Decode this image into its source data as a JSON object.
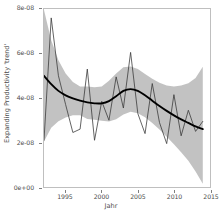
{
  "chart_data": {
    "type": "line",
    "title": "",
    "xlabel": "Jahr",
    "ylabel": "Expanding Productivity 'trend'",
    "xlim": [
      1992,
      2015
    ],
    "ylim": [
      0,
      8e-08
    ],
    "grid": false,
    "legend": null,
    "x_ticks": [
      1995,
      2000,
      2005,
      2010,
      2015
    ],
    "x_tick_labels": [
      "1995",
      "2000",
      "2005",
      "2010",
      "2015"
    ],
    "y_ticks": [
      0,
      2e-08,
      4e-08,
      6e-08,
      8e-08
    ],
    "y_tick_labels": [
      "0e+00",
      "2e-08",
      "4e-08",
      "6e-08",
      "8e-08"
    ],
    "colors": {
      "observed_line": "#3a3a3a",
      "trend_line": "#000000",
      "confidence_ribbon": "#bfbfbf",
      "panel_background": "#ffffff",
      "panel_border": "#bfbfbf",
      "axis_text": "#4d4d4d"
    },
    "series": [
      {
        "name": "observed",
        "type": "line",
        "x": [
          1992,
          1993,
          1994,
          1995,
          1996,
          1997,
          1998,
          1999,
          2000,
          2001,
          2002,
          2003,
          2004,
          2005,
          2006,
          2007,
          2008,
          2009,
          2010,
          2011,
          2012,
          2013,
          2014
        ],
        "values": [
          2.1e-08,
          7.6e-08,
          5e-08,
          3.7e-08,
          2.45e-08,
          2.6e-08,
          5.3e-08,
          2.1e-08,
          3.85e-08,
          3e-08,
          4.95e-08,
          3.55e-08,
          6.05e-08,
          3.3e-08,
          2.4e-08,
          4.65e-08,
          2.9e-08,
          1.95e-08,
          4.15e-08,
          2.3e-08,
          3.45e-08,
          2.5e-08,
          2.95e-08
        ]
      },
      {
        "name": "trend",
        "type": "line",
        "x": [
          1992,
          1993,
          1994,
          1995,
          1996,
          1997,
          1998,
          1999,
          2000,
          2001,
          2002,
          2003,
          2004,
          2005,
          2006,
          2007,
          2008,
          2009,
          2010,
          2011,
          2012,
          2013,
          2014
        ],
        "values": [
          5e-08,
          4.62e-08,
          4.32e-08,
          4.12e-08,
          3.98e-08,
          3.88e-08,
          3.8e-08,
          3.76e-08,
          3.76e-08,
          3.86e-08,
          4.08e-08,
          4.32e-08,
          4.4e-08,
          4.32e-08,
          4.12e-08,
          3.88e-08,
          3.64e-08,
          3.42e-08,
          3.22e-08,
          3.04e-08,
          2.88e-08,
          2.72e-08,
          2.6e-08
        ]
      }
    ],
    "ribbon": {
      "name": "confidence_interval",
      "x": [
        1992,
        1993,
        1994,
        1995,
        1996,
        1997,
        1998,
        1999,
        2000,
        2001,
        2002,
        2003,
        2004,
        2005,
        2006,
        2007,
        2008,
        2009,
        2010,
        2011,
        2012,
        2013,
        2014
      ],
      "upper": [
        7.95e-08,
        6.6e-08,
        5.7e-08,
        5.1e-08,
        4.72e-08,
        4.52e-08,
        4.52e-08,
        4.48e-08,
        4.52e-08,
        4.78e-08,
        5.1e-08,
        5.38e-08,
        5.42e-08,
        5.3e-08,
        5.08e-08,
        4.86e-08,
        4.68e-08,
        4.56e-08,
        4.52e-08,
        4.56e-08,
        4.66e-08,
        4.9e-08,
        5.4e-08
      ],
      "lower": [
        2.05e-08,
        2.66e-08,
        2.96e-08,
        3.12e-08,
        3.22e-08,
        3.22e-08,
        3.06e-08,
        3.02e-08,
        2.98e-08,
        2.94e-08,
        3.04e-08,
        3.26e-08,
        3.38e-08,
        3.32e-08,
        3.14e-08,
        2.88e-08,
        2.58e-08,
        2.26e-08,
        1.92e-08,
        1.56e-08,
        1.18e-08,
        7e-09,
        1.5e-09
      ]
    }
  }
}
